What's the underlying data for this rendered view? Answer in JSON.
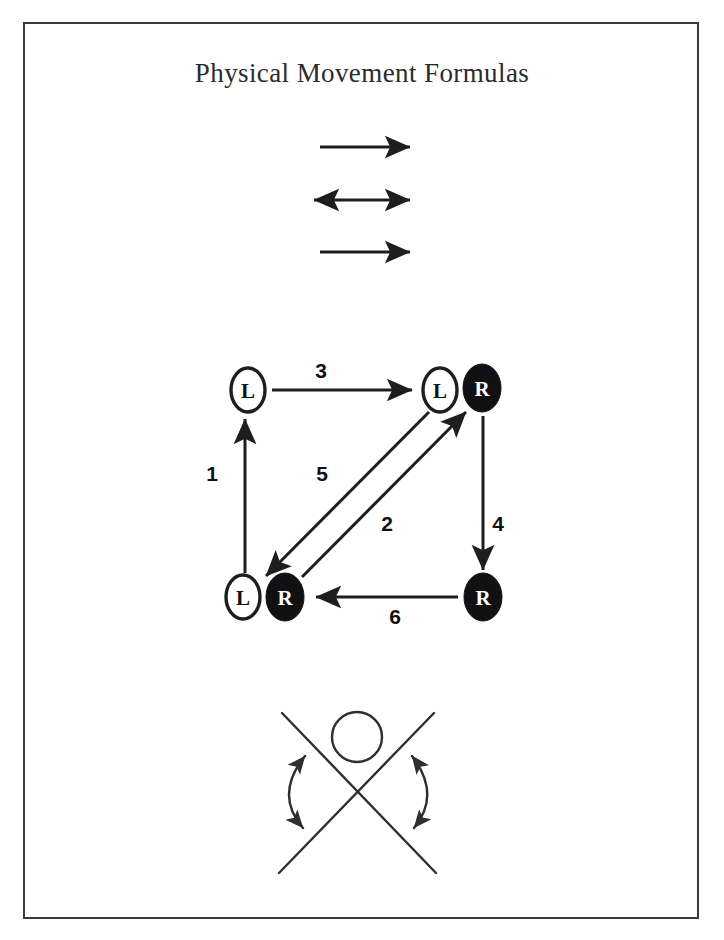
{
  "document": {
    "title": "Physical Movement Formulas",
    "frame_color": "#3a3a3c",
    "ink_color": "#1e1e20",
    "paper_color": "#ffffff"
  },
  "diagram_data": {
    "type": "diagram",
    "title": "Physical Movement Formulas",
    "sections": [
      {
        "id": "linear-arrows",
        "name": "linear-motion-arrows",
        "items": [
          {
            "id": "arrow-top",
            "direction": "right",
            "heads": 1,
            "x1": 320,
            "x2": 416,
            "y": 147
          },
          {
            "id": "arrow-middle",
            "direction": "both",
            "heads": 2,
            "x1": 308,
            "x2": 416,
            "y": 200
          },
          {
            "id": "arrow-bottom",
            "direction": "right",
            "heads": 1,
            "x1": 320,
            "x2": 416,
            "y": 252
          }
        ]
      },
      {
        "id": "foot-graph",
        "name": "foot-position-graph",
        "nodes": [
          {
            "id": "n-tl-L",
            "label": "L",
            "fill": "white",
            "cx": 248,
            "cy": 390
          },
          {
            "id": "n-tr-L",
            "label": "L",
            "fill": "white",
            "cx": 440,
            "cy": 390
          },
          {
            "id": "n-tr-R",
            "label": "R",
            "fill": "black",
            "cx": 482,
            "cy": 388
          },
          {
            "id": "n-bl-L",
            "label": "L",
            "fill": "white",
            "cx": 243,
            "cy": 597
          },
          {
            "id": "n-bl-R",
            "label": "R",
            "fill": "black",
            "cx": 285,
            "cy": 597
          },
          {
            "id": "n-br-R",
            "label": "R",
            "fill": "black",
            "cx": 483,
            "cy": 597
          }
        ],
        "edges": [
          {
            "number": "1",
            "from": "n-bl-L",
            "to": "n-tl-L",
            "label_x": 212,
            "label_y": 473
          },
          {
            "number": "2",
            "from": "n-bl-R",
            "to": "n-tr-R",
            "label_x": 387,
            "label_y": 523
          },
          {
            "number": "3",
            "from": "n-tl-L",
            "to": "n-tr-L",
            "label_x": 321,
            "label_y": 370
          },
          {
            "number": "4",
            "from": "n-tr-R",
            "to": "n-br-R",
            "label_x": 498,
            "label_y": 523
          },
          {
            "number": "5",
            "from": "n-tr-L",
            "to": "n-bl-L",
            "label_x": 322,
            "label_y": 473
          },
          {
            "number": "6",
            "from": "n-br-R",
            "to": "n-bl-R",
            "label_x": 395,
            "label_y": 616
          }
        ]
      },
      {
        "id": "rotation-figure",
        "name": "crossing-legs-rotation-figure",
        "elements": [
          {
            "id": "cross-line-down",
            "type": "line",
            "x1": 282,
            "y1": 713,
            "x2": 436,
            "y2": 873
          },
          {
            "id": "cross-line-up",
            "type": "line",
            "x1": 434,
            "y1": 713,
            "x2": 279,
            "y2": 873
          },
          {
            "id": "pivot-circle",
            "type": "circle",
            "cx": 357,
            "cy": 737,
            "r": 25
          },
          {
            "id": "curved-arrow-left",
            "type": "arc",
            "heads": 2,
            "side": "left"
          },
          {
            "id": "curved-arrow-right",
            "type": "arc",
            "heads": 2,
            "side": "right"
          }
        ]
      }
    ]
  }
}
